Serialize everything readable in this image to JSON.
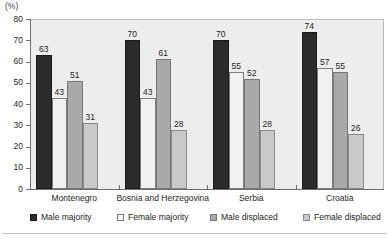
{
  "chart_data": {
    "type": "bar",
    "title": "",
    "subtitle": "",
    "unit_label": "(%)",
    "xlabel": "",
    "ylabel": "",
    "ylim": [
      0,
      80
    ],
    "ytick_step": 10,
    "yticks": [
      0,
      10,
      20,
      30,
      40,
      50,
      60,
      70,
      80
    ],
    "grid": false,
    "legend_position": "bottom",
    "categories": [
      "Montenegro",
      "Bosnia and Herzegovina",
      "Serbia",
      "Croatia"
    ],
    "series": [
      {
        "name": "Male majority",
        "color": "#2b2b2b",
        "values": [
          63,
          70,
          70,
          74
        ]
      },
      {
        "name": "Female majority",
        "color": "#f1f1f1",
        "values": [
          43,
          43,
          55,
          57
        ]
      },
      {
        "name": "Male displaced",
        "color": "#a9a9a9",
        "values": [
          51,
          61,
          52,
          55
        ]
      },
      {
        "name": "Female displaced",
        "color": "#c9c9c9",
        "values": [
          31,
          28,
          28,
          26
        ]
      }
    ]
  },
  "colors": {
    "plot_background": "#ededed",
    "axis": "#6d6d6d",
    "text": "#231f20"
  }
}
